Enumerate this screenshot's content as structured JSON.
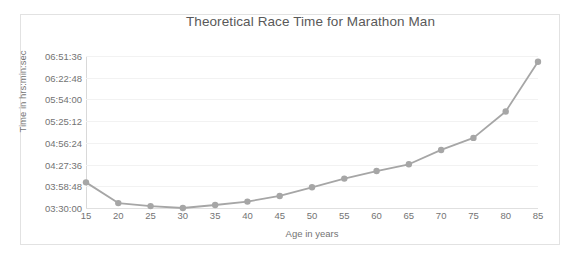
{
  "chart_data": {
    "type": "line",
    "title": "Theoretical Race Time for Marathon Man",
    "xlabel": "Age in years",
    "ylabel": "Time in hrs:min:sec",
    "grid": true,
    "legend": false,
    "categories": [
      15,
      20,
      25,
      30,
      35,
      40,
      45,
      50,
      55,
      60,
      65,
      70,
      75,
      80,
      85
    ],
    "x_tick_labels": [
      "15",
      "20",
      "25",
      "30",
      "35",
      "40",
      "45",
      "50",
      "55",
      "60",
      "65",
      "70",
      "75",
      "80",
      "85"
    ],
    "y_tick_labels": [
      "03:30:00",
      "03:58:48",
      "04:27:36",
      "04:56:24",
      "05:25:12",
      "05:54:00",
      "06:22:48",
      "06:51:36"
    ],
    "y_tick_values": [
      12600,
      14328,
      16056,
      17784,
      19512,
      21240,
      22968,
      24696
    ],
    "ylim": [
      12600,
      24696
    ],
    "xlim": [
      15,
      85
    ],
    "series": [
      {
        "name": "Theoretical Race Time",
        "values_hms": [
          "04:04:00",
          "03:36:30",
          "03:32:30",
          "03:30:00",
          "03:34:00",
          "03:38:30",
          "03:46:00",
          "03:57:30",
          "04:09:00",
          "04:19:00",
          "04:28:00",
          "04:47:00",
          "05:03:00",
          "05:38:00",
          "06:44:00"
        ],
        "values_seconds": [
          14640,
          12990,
          12750,
          12600,
          12840,
          13110,
          13560,
          14250,
          14940,
          15540,
          16080,
          17220,
          18180,
          20280,
          24240
        ],
        "color": "#a6a6a6",
        "marker": "circle"
      }
    ]
  },
  "colors": {
    "line": "#a6a6a6",
    "marker": "#a6a6a6",
    "gridline": "#f2f2f2",
    "axis": "#d9d9d9",
    "text": "#737373",
    "title_text": "#595959",
    "frame_border": "#e2e2e2",
    "background": "#ffffff"
  }
}
